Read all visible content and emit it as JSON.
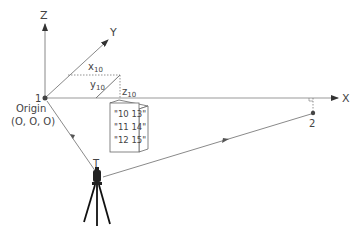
{
  "axes": {
    "x_label": "X",
    "y_label": "Y",
    "z_label": "Z"
  },
  "origin": {
    "point_label": "1",
    "name": "Origin",
    "coords": "(O, O, O)"
  },
  "components": {
    "x": "x",
    "x_sub": "10",
    "y": "y",
    "y_sub": "10",
    "z": "z",
    "z_sub": "10"
  },
  "panel": {
    "rows": [
      "\"10 13\"",
      "\"11 14\"",
      "\"12 15\""
    ]
  },
  "point2": {
    "label": "2"
  },
  "instrument": {
    "label": "T"
  },
  "colors": {
    "line": "#8a8a8a",
    "axis": "#888888",
    "text": "#444444",
    "dot": "#444444"
  }
}
